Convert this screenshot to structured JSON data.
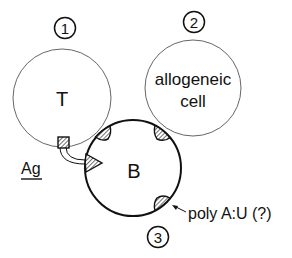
{
  "diagram": {
    "cells": [
      {
        "id": "t-cell",
        "number": "1",
        "label": "T"
      },
      {
        "id": "allogeneic-cell",
        "number": "2",
        "label_lines": [
          "allogeneic",
          "cell"
        ]
      },
      {
        "id": "b-cell",
        "number": "3",
        "label": "B"
      }
    ],
    "antigen_label": "Ag",
    "polyau_label": "poly A:U (?)",
    "colors": {
      "stroke": "#111111",
      "thin_stroke": "#555555",
      "background": "#ffffff"
    }
  }
}
